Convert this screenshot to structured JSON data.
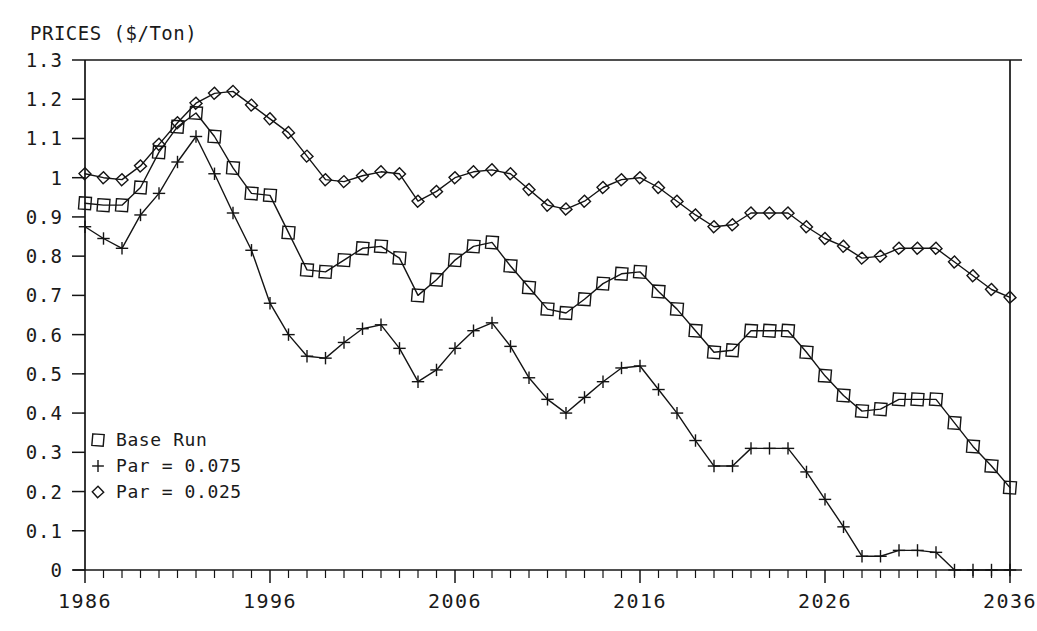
{
  "chart_data": {
    "type": "line",
    "title": "PRICES ($/Ton)",
    "xlabel": "",
    "ylabel": "PRICES ($/Ton)",
    "xlim": [
      1986,
      2036
    ],
    "ylim": [
      0,
      1.3
    ],
    "grid": false,
    "legend_position": "lower-left-inside",
    "x_tick_labels": [
      "1986",
      "1996",
      "2006",
      "2016",
      "2026",
      "2036"
    ],
    "x_tick_values": [
      1986,
      1996,
      2006,
      2016,
      2026,
      2036
    ],
    "x_minor_tick_step": 1,
    "y_tick_labels": [
      "1.3",
      "1.2",
      "1.1",
      "1",
      "0.9",
      "0.8",
      "0.7",
      "0.6",
      "0.5",
      "0.4",
      "0.3",
      "0.2",
      "0.1",
      "0"
    ],
    "y_tick_values": [
      1.3,
      1.2,
      1.1,
      1.0,
      0.9,
      0.8,
      0.7,
      0.6,
      0.5,
      0.4,
      0.3,
      0.2,
      0.1,
      0
    ],
    "x": [
      1986,
      1987,
      1988,
      1989,
      1990,
      1991,
      1992,
      1993,
      1994,
      1995,
      1996,
      1997,
      1998,
      1999,
      2000,
      2001,
      2002,
      2003,
      2004,
      2005,
      2006,
      2007,
      2008,
      2009,
      2010,
      2011,
      2012,
      2013,
      2014,
      2015,
      2016,
      2017,
      2018,
      2019,
      2020,
      2021,
      2022,
      2023,
      2024,
      2025,
      2026,
      2027,
      2028,
      2029,
      2030,
      2031,
      2032,
      2033,
      2034,
      2035,
      2036
    ],
    "series": [
      {
        "name": "Base Run",
        "marker": "square",
        "values": [
          0.935,
          0.93,
          0.93,
          0.975,
          1.065,
          1.13,
          1.165,
          1.105,
          1.025,
          0.96,
          0.955,
          0.86,
          0.765,
          0.76,
          0.79,
          0.82,
          0.825,
          0.795,
          0.7,
          0.74,
          0.79,
          0.825,
          0.835,
          0.775,
          0.72,
          0.665,
          0.655,
          0.69,
          0.73,
          0.755,
          0.76,
          0.71,
          0.665,
          0.61,
          0.555,
          0.56,
          0.61,
          0.61,
          0.61,
          0.555,
          0.495,
          0.445,
          0.405,
          0.41,
          0.435,
          0.435,
          0.435,
          0.375,
          0.315,
          0.265,
          0.21
        ]
      },
      {
        "name": "Par = 0.075",
        "marker": "plus",
        "values": [
          0.875,
          0.845,
          0.82,
          0.905,
          0.96,
          1.04,
          1.105,
          1.01,
          0.91,
          0.815,
          0.68,
          0.6,
          0.545,
          0.54,
          0.58,
          0.615,
          0.625,
          0.565,
          0.48,
          0.51,
          0.565,
          0.61,
          0.63,
          0.57,
          0.49,
          0.435,
          0.4,
          0.44,
          0.48,
          0.515,
          0.52,
          0.46,
          0.4,
          0.33,
          0.265,
          0.265,
          0.31,
          0.31,
          0.31,
          0.25,
          0.18,
          0.11,
          0.035,
          0.035,
          0.05,
          0.05,
          0.045,
          0.0,
          0.0,
          0.0,
          0.0
        ]
      },
      {
        "name": "Par = 0.025",
        "marker": "diamond",
        "values": [
          1.01,
          1.0,
          0.995,
          1.03,
          1.085,
          1.14,
          1.19,
          1.215,
          1.22,
          1.185,
          1.15,
          1.115,
          1.055,
          0.995,
          0.99,
          1.005,
          1.015,
          1.01,
          0.94,
          0.965,
          1.0,
          1.015,
          1.02,
          1.01,
          0.97,
          0.93,
          0.92,
          0.94,
          0.975,
          0.995,
          1.0,
          0.975,
          0.94,
          0.905,
          0.875,
          0.88,
          0.91,
          0.91,
          0.91,
          0.875,
          0.845,
          0.825,
          0.795,
          0.8,
          0.82,
          0.82,
          0.82,
          0.785,
          0.75,
          0.715,
          0.695
        ]
      }
    ]
  },
  "legend": {
    "items": [
      {
        "label": "Base Run",
        "marker": "square"
      },
      {
        "label": "Par = 0.075",
        "marker": "plus"
      },
      {
        "label": "Par = 0.025",
        "marker": "diamond"
      }
    ]
  },
  "colors": {
    "ink": "#141414",
    "background": "#ffffff"
  }
}
